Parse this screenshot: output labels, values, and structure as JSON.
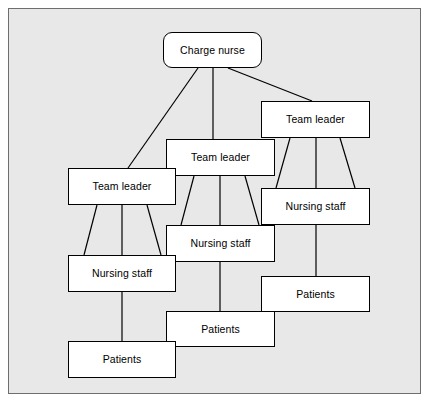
{
  "diagram": {
    "type": "hierarchy-tree",
    "background_color": "#e8e8e8",
    "frame_border_color": "#6e6e6e",
    "node_fill_color": "#ffffff",
    "node_border_color": "#000000",
    "shadow_color": "#000000",
    "connector_color": "#000000",
    "nodes": [
      {
        "id": "charge-nurse",
        "label": "Charge nurse",
        "shape": "rounded-rect",
        "x": 163,
        "y": 32,
        "w": 99,
        "h": 36,
        "level": 0,
        "column": "center"
      },
      {
        "id": "team-leader-right",
        "label": "Team leader",
        "shape": "rect",
        "x": 261,
        "y": 101,
        "w": 109,
        "h": 37,
        "level": 1,
        "column": "right"
      },
      {
        "id": "team-leader-middle",
        "label": "Team leader",
        "shape": "rect",
        "x": 166,
        "y": 139,
        "w": 109,
        "h": 37,
        "level": 1,
        "column": "middle"
      },
      {
        "id": "team-leader-left",
        "label": "Team leader",
        "shape": "rect",
        "x": 68,
        "y": 168,
        "w": 108,
        "h": 37,
        "level": 1,
        "column": "left"
      },
      {
        "id": "nursing-staff-right",
        "label": "Nursing staff",
        "shape": "rect",
        "x": 261,
        "y": 188,
        "w": 109,
        "h": 37,
        "level": 2,
        "column": "right"
      },
      {
        "id": "nursing-staff-middle",
        "label": "Nursing staff",
        "shape": "rect",
        "x": 166,
        "y": 225,
        "w": 109,
        "h": 37,
        "level": 2,
        "column": "middle"
      },
      {
        "id": "nursing-staff-left",
        "label": "Nursing staff",
        "shape": "rect",
        "x": 68,
        "y": 255,
        "w": 108,
        "h": 37,
        "level": 2,
        "column": "left"
      },
      {
        "id": "patients-right",
        "label": "Patients",
        "shape": "rect",
        "x": 261,
        "y": 276,
        "w": 109,
        "h": 36,
        "level": 3,
        "column": "right"
      },
      {
        "id": "patients-middle",
        "label": "Patients",
        "shape": "rect",
        "x": 166,
        "y": 311,
        "w": 109,
        "h": 36,
        "level": 3,
        "column": "middle"
      },
      {
        "id": "patients-left",
        "label": "Patients",
        "shape": "rect",
        "x": 68,
        "y": 341,
        "w": 108,
        "h": 37,
        "level": 3,
        "column": "left"
      }
    ],
    "edges": [
      {
        "from": "charge-nurse",
        "to": "team-leader-left",
        "x1": 198,
        "y1": 68,
        "x2": 128,
        "y2": 168
      },
      {
        "from": "charge-nurse",
        "to": "team-leader-middle",
        "x1": 213,
        "y1": 68,
        "x2": 213,
        "y2": 139
      },
      {
        "from": "charge-nurse",
        "to": "team-leader-right",
        "x1": 228,
        "y1": 68,
        "x2": 312,
        "y2": 101
      },
      {
        "from": "team-leader-right",
        "to": "nursing-staff-right",
        "x1": 290,
        "y1": 138,
        "x2": 276,
        "y2": 188
      },
      {
        "from": "team-leader-right",
        "to": "nursing-staff-right",
        "x1": 316,
        "y1": 138,
        "x2": 316,
        "y2": 188
      },
      {
        "from": "team-leader-right",
        "to": "nursing-staff-right",
        "x1": 340,
        "y1": 138,
        "x2": 355,
        "y2": 188
      },
      {
        "from": "team-leader-middle",
        "to": "nursing-staff-middle",
        "x1": 194,
        "y1": 176,
        "x2": 181,
        "y2": 225
      },
      {
        "from": "team-leader-middle",
        "to": "nursing-staff-middle",
        "x1": 220,
        "y1": 176,
        "x2": 220,
        "y2": 225
      },
      {
        "from": "team-leader-middle",
        "to": "nursing-staff-middle",
        "x1": 245,
        "y1": 176,
        "x2": 259,
        "y2": 225
      },
      {
        "from": "team-leader-left",
        "to": "nursing-staff-left",
        "x1": 97,
        "y1": 205,
        "x2": 84,
        "y2": 255
      },
      {
        "from": "team-leader-left",
        "to": "nursing-staff-left",
        "x1": 122,
        "y1": 205,
        "x2": 122,
        "y2": 255
      },
      {
        "from": "team-leader-left",
        "to": "nursing-staff-left",
        "x1": 147,
        "y1": 205,
        "x2": 161,
        "y2": 255
      },
      {
        "from": "nursing-staff-right",
        "to": "patients-right",
        "x1": 316,
        "y1": 225,
        "x2": 316,
        "y2": 276
      },
      {
        "from": "nursing-staff-middle",
        "to": "patients-middle",
        "x1": 220,
        "y1": 262,
        "x2": 220,
        "y2": 311
      },
      {
        "from": "nursing-staff-left",
        "to": "patients-left",
        "x1": 122,
        "y1": 292,
        "x2": 122,
        "y2": 341
      }
    ]
  }
}
